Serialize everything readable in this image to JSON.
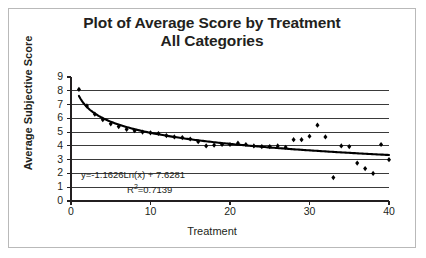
{
  "chart": {
    "title_line1": "Plot of Average Score by Treatment",
    "title_line2": "All Categories",
    "y_axis_title": "Average Subjective Score",
    "x_axis_title": "Treatment",
    "equation": "y=-1.1626Ln(x) + 7.6281",
    "r_squared_prefix": "R",
    "r_squared_sup": "2",
    "r_squared_value": "=0.7139"
  },
  "chart_data": {
    "type": "scatter",
    "title": "Plot of Average Score by Treatment All Categories",
    "xlabel": "Treatment",
    "ylabel": "Average Subjective Score",
    "xlim": [
      0,
      40
    ],
    "ylim": [
      0,
      9
    ],
    "xticks": [
      0,
      10,
      20,
      30,
      40
    ],
    "yticks": [
      0,
      1,
      2,
      3,
      4,
      5,
      6,
      7,
      8,
      9
    ],
    "grid": true,
    "grid_orientation": "horizontal",
    "legend": "none",
    "marker": "diamond",
    "marker_color": "#000000",
    "trendline": {
      "type": "logarithmic",
      "equation": "y=-1.1626Ln(x) + 7.6281",
      "slope": -1.1626,
      "intercept": 7.6281,
      "r_squared": 0.7139,
      "color": "#000000"
    },
    "series": [
      {
        "name": "Average Subjective Score",
        "x": [
          1,
          2,
          3,
          4,
          5,
          6,
          7,
          8,
          9,
          10,
          11,
          12,
          13,
          14,
          15,
          16,
          17,
          18,
          19,
          20,
          21,
          22,
          23,
          24,
          25,
          26,
          27,
          28,
          29,
          30,
          31,
          32,
          33,
          34,
          35,
          36,
          37,
          38,
          39,
          40
        ],
        "y": [
          8.1,
          6.9,
          6.3,
          5.9,
          5.6,
          5.4,
          5.2,
          5.1,
          5.0,
          4.95,
          4.9,
          4.75,
          4.65,
          4.6,
          4.5,
          4.3,
          4.0,
          4.05,
          4.1,
          4.1,
          4.2,
          4.1,
          4.0,
          3.95,
          3.95,
          4.0,
          3.9,
          4.45,
          4.45,
          4.7,
          5.5,
          4.65,
          1.7,
          4.0,
          3.95,
          2.75,
          2.35,
          2.0,
          4.1,
          3.0
        ]
      }
    ]
  }
}
